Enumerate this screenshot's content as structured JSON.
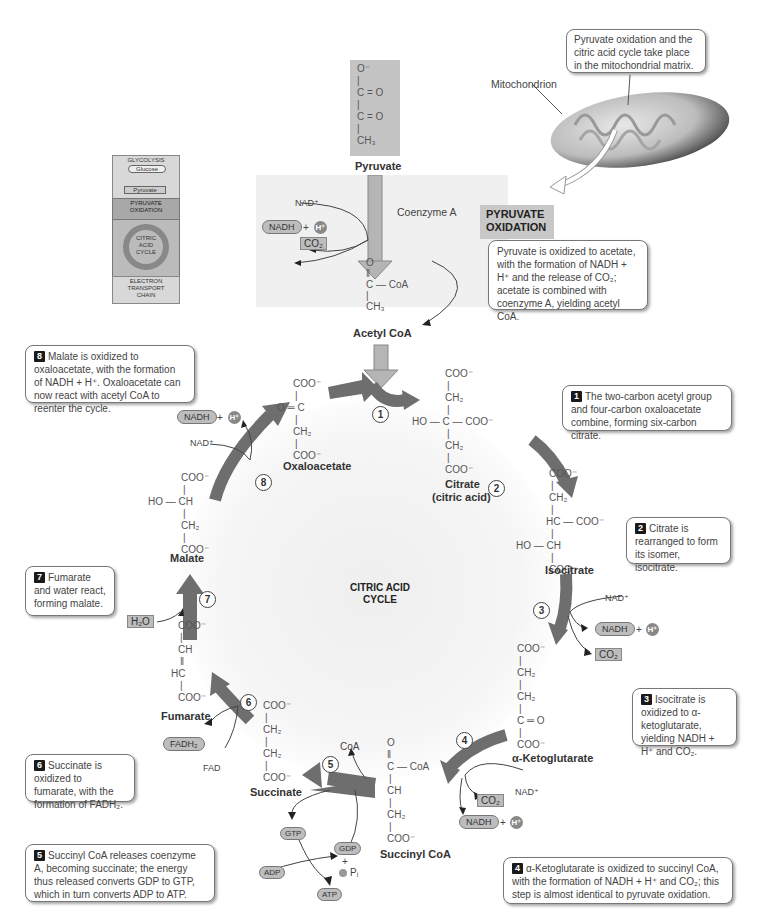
{
  "overview": {
    "glycolysis": "GLYCOLYSIS",
    "glucose": "Glucose",
    "pyruvate": "Pyruvate",
    "pyruvate_oxidation": [
      "PYRUVATE",
      "OXIDATION"
    ],
    "citric_acid_cycle": [
      "CITRIC",
      "ACID",
      "CYCLE"
    ],
    "electron_transport": [
      "ELECTRON",
      "TRANSPORT",
      "CHAIN"
    ]
  },
  "mitochondrion": {
    "label": "Mitochondrion",
    "callout": "Pyruvate oxidation and the citric acid cycle take place in the mitochondrial matrix."
  },
  "pyruvate_oxidation": {
    "title_line1": "PYRUVATE",
    "title_line2": "OXIDATION",
    "description": "Pyruvate is oxidized to acetate, with the formation of NADH + H⁺ and the release of CO₂; acetate is combined with  coenzyme A, yielding acetyl CoA.",
    "pyruvate_label": "Pyruvate",
    "pyruvate_structure": [
      "O⁻",
      "C = O",
      "C = O",
      "CH₃"
    ],
    "acetyl_coa_label": "Acetyl CoA",
    "acetyl_structure": [
      "O",
      "C — CoA",
      "CH₃"
    ],
    "nad_plus": "NAD⁺",
    "nadh": "NADH",
    "h_plus": "H⁺",
    "co2": "CO₂",
    "coenzyme_a": "Coenzyme A"
  },
  "cycle": {
    "center_label_line1": "CITRIC ACID",
    "center_label_line2": "CYCLE",
    "molecules": {
      "oxaloacetate": "Oxaloacetate",
      "citrate": "Citrate",
      "citrate_sub": "(citric acid)",
      "isocitrate": "Isocitrate",
      "alpha_ketoglutarate": "α-Ketoglutarate",
      "succinyl_coa": "Succinyl CoA",
      "succinate": "Succinate",
      "fumarate": "Fumarate",
      "malate": "Malate"
    },
    "cofactors": {
      "nad_plus": "NAD⁺",
      "nadh": "NADH",
      "h_plus": "H⁺",
      "co2": "CO₂",
      "fad": "FAD",
      "fadh2": "FADH₂",
      "h2o": "H₂O",
      "coa": "CoA",
      "gtp": "GTP",
      "gdp": "GDP",
      "adp": "ADP",
      "atp": "ATP",
      "pi": "Pᵢ",
      "plus": "+"
    },
    "step_numbers": [
      "1",
      "2",
      "3",
      "4",
      "5",
      "6",
      "7",
      "8"
    ]
  },
  "callouts": [
    {
      "step": "1",
      "text": "The two-carbon acetyl group and four-carbon oxaloacetate combine, forming six-carbon citrate."
    },
    {
      "step": "2",
      "text": "Citrate is rearranged to form its isomer, isocitrate."
    },
    {
      "step": "3",
      "text": "Isocitrate is oxidized to α-ketoglutarate, yielding NADH + H⁺ and CO₂."
    },
    {
      "step": "4",
      "text": "α-Ketoglutarate is oxidized to succinyl CoA, with the formation of NADH + H⁺ and CO₂; this step is almost identical to pyruvate oxidation."
    },
    {
      "step": "5",
      "text": "Succinyl CoA releases coenzyme A, becoming succinate; the energy thus released converts GDP to GTP, which in turn converts ADP to ATP."
    },
    {
      "step": "6",
      "text": "Succinate is oxidized to fumarate, with the formation of FADH₂."
    },
    {
      "step": "7",
      "text": "Fumarate and water react, forming malate."
    },
    {
      "step": "8",
      "text": "Malate is oxidized to oxaloacetate, with the formation of NADH + H⁺. Oxaloacetate can now react with acetyl CoA to reenter the cycle."
    }
  ],
  "colors": {
    "arrow_dark": "#6e6e6e",
    "arrow_light": "#b5b5b5",
    "panel_bg": "#f0f0f0",
    "pill_bg": "#bdbdbd"
  }
}
